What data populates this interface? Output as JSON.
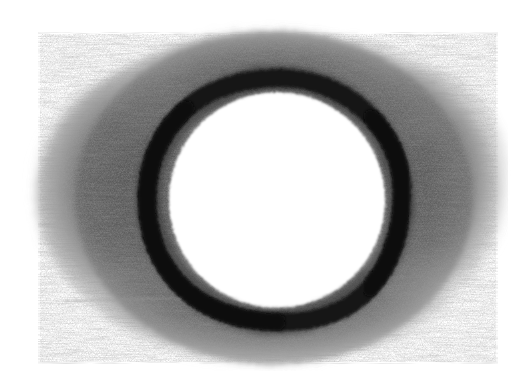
{
  "artwork": {
    "title": "Charcoal Ring",
    "medium": "graphite-charcoal-sketch",
    "canvas": {
      "width": 524,
      "height": 387,
      "background_color": "#ffffff"
    },
    "subject": "dark circular ring surrounded by a soft smudged grey halo",
    "palette": {
      "paper_white": "#ffffff",
      "smudge_light": "#b4b4b4",
      "smudge_mid": "#7c7c7c",
      "smudge_dark": "#5e5e5e",
      "ring_black": "#141414",
      "ring_edge": "#2e2e2e",
      "hole_white": "#ffffff",
      "streak_light": "#9a9a9a"
    },
    "elements": [
      {
        "name": "smudge-halo",
        "shape": "irregular-ellipse",
        "center_x": 268,
        "center_y": 198,
        "radius_x": 236,
        "radius_y": 168,
        "bounds": {
          "left": 30,
          "top": 28,
          "right": 502,
          "bottom": 366
        },
        "fill_color": "#6e6e6e",
        "opacity": 0.92,
        "edge": "feathered"
      },
      {
        "name": "ring-stroke",
        "shape": "annulus",
        "center_x": 276,
        "center_y": 200,
        "radius": 122,
        "stroke_width": 18,
        "stroke_color": "#141414",
        "bounds": {
          "left": 145,
          "top": 76,
          "right": 403,
          "bottom": 323
        }
      },
      {
        "name": "inner-hole",
        "shape": "circle",
        "center_x": 277,
        "center_y": 200,
        "radius": 113,
        "fill_color": "#ffffff"
      },
      {
        "name": "horizontal-streak",
        "shape": "line",
        "x1": 70,
        "y1": 300,
        "x2": 330,
        "y2": 296,
        "stroke_color": "#9a9a9a",
        "stroke_width": 2,
        "opacity": 0.45
      }
    ],
    "texture": {
      "type": "charcoal-grain",
      "base_frequency": 0.62,
      "octaves": 4,
      "seed": 7,
      "scale": 26
    }
  }
}
